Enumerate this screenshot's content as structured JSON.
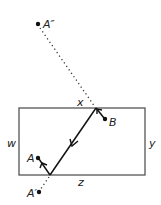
{
  "diagram": {
    "type": "reflection-path",
    "labels": {
      "a_double_prime": "A″",
      "x": "x",
      "b": "B",
      "w": "w",
      "y": "y",
      "a": "A",
      "z": "z",
      "a_prime": "A′"
    },
    "rectangle": {
      "x": 19,
      "y": 108,
      "width": 126,
      "height": 67,
      "stroke": "#555555"
    },
    "points": {
      "a_double_prime": {
        "x": 38,
        "y": 24
      },
      "reflect_top": {
        "x": 96,
        "y": 108
      },
      "b": {
        "x": 105,
        "y": 119
      },
      "reflect_bottom": {
        "x": 50,
        "y": 175
      },
      "a": {
        "x": 38,
        "y": 158
      },
      "a_prime": {
        "x": 39,
        "y": 192
      }
    },
    "colors": {
      "path": "#111111",
      "dotted": "#333333",
      "box": "#555555"
    }
  }
}
